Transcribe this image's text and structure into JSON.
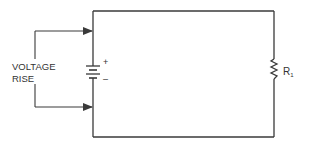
{
  "diagram": {
    "type": "circuit-schematic",
    "labels": {
      "voltage_line1": "VOLTAGE",
      "voltage_line2": "RISE",
      "battery_plus": "+",
      "battery_minus": "–",
      "resistor_name": "R",
      "resistor_subscript": "1"
    },
    "components": [
      {
        "kind": "battery",
        "polarity_top": "+",
        "polarity_bottom": "-"
      },
      {
        "kind": "resistor",
        "name": "R1"
      }
    ],
    "annotation": "VOLTAGE RISE",
    "colors": {
      "wire": "#3a3a3a",
      "text": "#333333",
      "background": "#ffffff"
    }
  }
}
